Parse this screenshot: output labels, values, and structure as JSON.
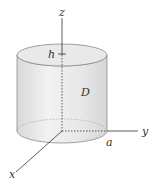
{
  "diagram": {
    "type": "3d-cylinder-region",
    "labels": {
      "z_axis": "z",
      "y_axis": "y",
      "x_axis": "x",
      "height": "h",
      "region": "D",
      "radius": "a"
    },
    "colors": {
      "cylinder_fill": "#e6e6e6",
      "cylinder_side_light": "#f0f0f0",
      "top_fill": "#eaeaea",
      "outline": "#8a8a8a",
      "axis": "#333333",
      "dashed": "#333333"
    }
  }
}
